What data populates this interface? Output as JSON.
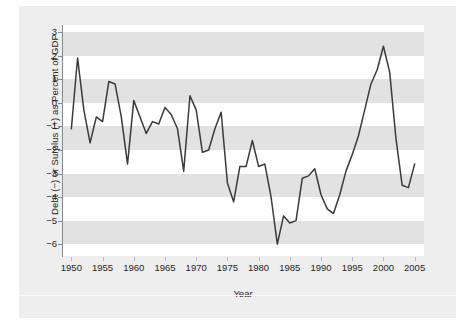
{
  "chart_data": {
    "type": "line",
    "title": "",
    "xlabel": "Year",
    "ylabel": "Debt (−) or Surplus (+) as Percent of GDP",
    "xlim": [
      1948.5,
      2006.5
    ],
    "ylim": [
      -6.5,
      3.3
    ],
    "xticks": [
      1950,
      1955,
      1960,
      1965,
      1970,
      1975,
      1980,
      1985,
      1990,
      1995,
      2000,
      2005
    ],
    "yticks": [
      3,
      2,
      1,
      0,
      -1,
      -2,
      -3,
      -4,
      -5,
      -6
    ],
    "ytick_labels": [
      "3",
      "2",
      "1",
      "0",
      "−1",
      "−2",
      "−3",
      "−4",
      "−5",
      "−6"
    ],
    "grid": false,
    "banded_background": true,
    "band_unit": 1,
    "legend": null,
    "line_color": "#3a3a3a",
    "band_color": "#e2e2e2",
    "plot_background": "#ffffff",
    "figure_background": "#eeeeee",
    "x": [
      1950,
      1951,
      1952,
      1953,
      1954,
      1955,
      1956,
      1957,
      1958,
      1959,
      1960,
      1961,
      1962,
      1963,
      1964,
      1965,
      1966,
      1967,
      1968,
      1969,
      1970,
      1971,
      1972,
      1973,
      1974,
      1975,
      1976,
      1977,
      1978,
      1979,
      1980,
      1981,
      1982,
      1983,
      1984,
      1985,
      1986,
      1987,
      1988,
      1989,
      1990,
      1991,
      1992,
      1993,
      1994,
      1995,
      1996,
      1997,
      1998,
      1999,
      2000,
      2001,
      2002,
      2003,
      2004,
      2005
    ],
    "values": [
      -1.1,
      1.9,
      -0.3,
      -1.7,
      -0.6,
      -0.8,
      0.9,
      0.8,
      -0.6,
      -2.6,
      0.1,
      -0.6,
      -1.3,
      -0.8,
      -0.9,
      -0.2,
      -0.5,
      -1.1,
      -2.9,
      0.3,
      -0.3,
      -2.1,
      -2.0,
      -1.1,
      -0.4,
      -3.4,
      -4.2,
      -2.7,
      -2.7,
      -1.6,
      -2.7,
      -2.6,
      -4.0,
      -6.0,
      -4.8,
      -5.1,
      -5.0,
      -3.2,
      -3.1,
      -2.8,
      -3.9,
      -4.5,
      -4.7,
      -3.9,
      -2.9,
      -2.2,
      -1.4,
      -0.3,
      0.8,
      1.4,
      2.4,
      1.3,
      -1.5,
      -3.5,
      -3.6,
      -2.6
    ],
    "series_name": "Deficit or Surplus as Percent of GDP"
  }
}
